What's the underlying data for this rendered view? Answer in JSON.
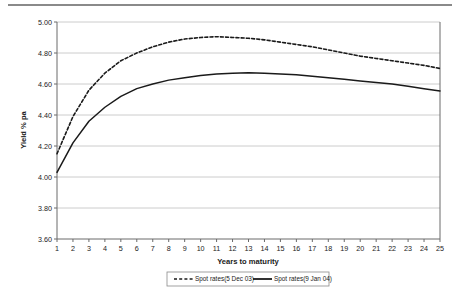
{
  "chart_data": {
    "type": "line",
    "title": "",
    "xlabel": "Years to maturity",
    "ylabel": "Yield % pa",
    "xlim": [
      1,
      25
    ],
    "ylim": [
      3.6,
      5.0
    ],
    "ytick_step": 0.2,
    "grid": "horizontal",
    "legend_position": "bottom",
    "x": [
      1,
      2,
      3,
      4,
      5,
      6,
      7,
      8,
      9,
      10,
      11,
      12,
      13,
      14,
      15,
      16,
      17,
      18,
      19,
      20,
      21,
      22,
      23,
      24,
      25
    ],
    "xticklabels": [
      "1",
      "2",
      "3",
      "4",
      "5",
      "6",
      "7",
      "8",
      "9",
      "10",
      "11",
      "12",
      "13",
      "14",
      "15",
      "16",
      "17",
      "18",
      "19",
      "20",
      "21",
      "22",
      "23",
      "24",
      "25"
    ],
    "yticklabels": [
      "3.60",
      "3.80",
      "4.00",
      "4.20",
      "4.40",
      "4.60",
      "4.80",
      "5.00"
    ],
    "yticks": [
      3.6,
      3.8,
      4.0,
      4.2,
      4.4,
      4.6,
      4.8,
      5.0
    ],
    "series": [
      {
        "name": "Spot rates(5 Dec 03)",
        "style": "dashed",
        "color": "#1a1a1a",
        "values": [
          4.15,
          4.39,
          4.56,
          4.67,
          4.75,
          4.8,
          4.84,
          4.87,
          4.89,
          4.9,
          4.905,
          4.9,
          4.895,
          4.885,
          4.87,
          4.855,
          4.84,
          4.82,
          4.8,
          4.78,
          4.765,
          4.75,
          4.735,
          4.72,
          4.7
        ]
      },
      {
        "name": "Spot rates(9 Jan 04)",
        "style": "solid",
        "color": "#1a1a1a",
        "values": [
          4.03,
          4.22,
          4.36,
          4.45,
          4.52,
          4.57,
          4.6,
          4.625,
          4.64,
          4.655,
          4.665,
          4.67,
          4.672,
          4.67,
          4.665,
          4.66,
          4.65,
          4.64,
          4.63,
          4.62,
          4.61,
          4.6,
          4.585,
          4.57,
          4.555
        ]
      }
    ]
  },
  "legend": {
    "items": [
      {
        "label": "Spot rates(5 Dec 03)",
        "style": "dashed"
      },
      {
        "label": "Spot rates(9 Jan 04)",
        "style": "solid"
      }
    ]
  }
}
